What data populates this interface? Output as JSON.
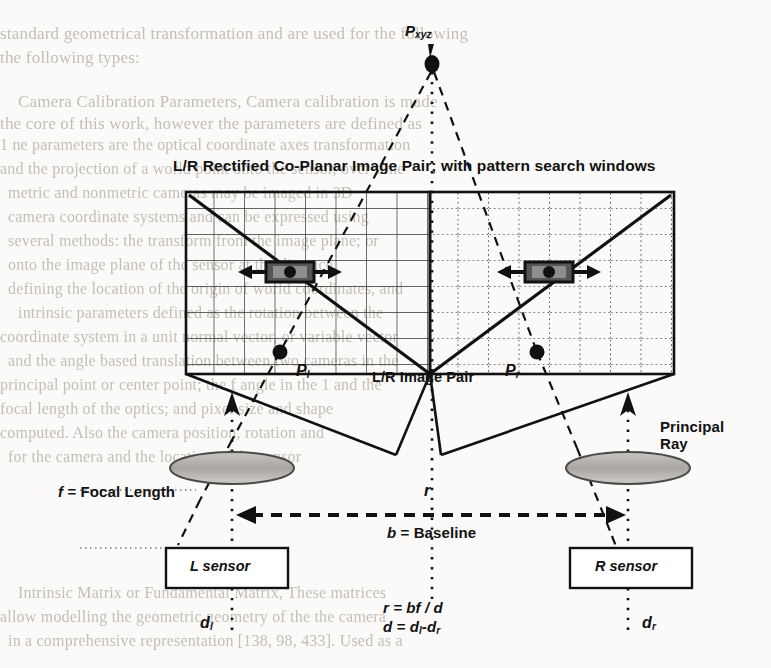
{
  "page": {
    "width": 771,
    "height": 668,
    "background_color": "#fbfaf8",
    "ink_color": "#111111",
    "bleed_text_color": "#b9b4ad"
  },
  "diagram": {
    "type": "stereo-camera-geometry",
    "title": "L/R Rectified Co-Planar Image Pair; with pattern search windows",
    "labels": {
      "world_point": "P",
      "world_point_sub": "xyz",
      "left_point": "P",
      "left_point_sub": "l",
      "right_point": "P",
      "right_point_sub": "r",
      "image_pair": "L/R Image Pair",
      "principal_ray": "Principal Ray",
      "focal_length": "f = Focal Length",
      "focal_length_symbol": "f",
      "focal_length_text": "= Focal Length",
      "baseline": "b = Baseline",
      "baseline_symbol": "b",
      "baseline_text": "= Baseline",
      "range": "r",
      "left_sensor": "L sensor",
      "right_sensor": "R sensor",
      "disparity_left": "d",
      "disparity_left_sub": "l",
      "disparity_right": "d",
      "disparity_right_sub": "r"
    },
    "formulas": [
      {
        "lhs": "r",
        "rhs": "= bf / d"
      },
      {
        "lhs": "d",
        "rhs": "= d",
        "sub1": "l",
        "mid": "-d",
        "sub2": "r"
      }
    ],
    "formula_lines": [
      "r = bf / d",
      "d = dl-dr"
    ],
    "left_image": {
      "grid_style": "solid",
      "diagonal": "descending"
    },
    "right_image": {
      "grid_style": "dotted",
      "diagonal": "ascending"
    },
    "search_windows": [
      {
        "side": "left",
        "arrows": "bidirectional"
      },
      {
        "side": "right",
        "arrows": "bidirectional"
      }
    ]
  },
  "background_text": {
    "lines": [
      {
        "text": "standard geometrical transformation and are used for the following",
        "x": 0,
        "y": 24,
        "size": 17,
        "mirror": false
      },
      {
        "text": "the following types:",
        "x": 0,
        "y": 48,
        "size": 17,
        "mirror": false
      },
      {
        "text": "Camera Calibration Parameters, Camera calibration is made",
        "x": 18,
        "y": 92,
        "size": 17,
        "mirror": false
      },
      {
        "text": "the core of this work, however the parameters are defined as",
        "x": 0,
        "y": 114,
        "size": 17,
        "mirror": false
      },
      {
        "text": "1 ne parameters are the optical coordinate axes transformation",
        "x": 0,
        "y": 136,
        "size": 16,
        "mirror": false
      },
      {
        "text": "and the projection of a world point onto the sensor, over-time",
        "x": 0,
        "y": 160,
        "size": 16,
        "mirror": false
      },
      {
        "text": "metric and nonmetric cameras may be imaged in 3D",
        "x": 8,
        "y": 184,
        "size": 16,
        "mirror": false
      },
      {
        "text": "camera coordinate systems and can be expressed using",
        "x": 8,
        "y": 208,
        "size": 16,
        "mirror": false
      },
      {
        "text": "several methods: the transform from the image plane; or",
        "x": 8,
        "y": 232,
        "size": 16,
        "mirror": false
      },
      {
        "text": "onto the image plane of the sensor at the distance",
        "x": 8,
        "y": 256,
        "size": 16,
        "mirror": false
      },
      {
        "text": "defining the location of the origin of world coordinates, and",
        "x": 8,
        "y": 280,
        "size": 16,
        "mirror": false
      },
      {
        "text": "intrinsic parameters defined as the rotation between the",
        "x": 18,
        "y": 304,
        "size": 16,
        "mirror": false
      },
      {
        "text": "coordinate system in a unit normal vector, or variable vector",
        "x": 0,
        "y": 328,
        "size": 16,
        "mirror": false
      },
      {
        "text": "and the angle based translation between two cameras in the",
        "x": 8,
        "y": 352,
        "size": 16,
        "mirror": false
      },
      {
        "text": "principal point or center point; the f angle in the 1 and the",
        "x": 0,
        "y": 376,
        "size": 16,
        "mirror": false
      },
      {
        "text": "focal length of the optics; and pixel size and shape",
        "x": 0,
        "y": 400,
        "size": 16,
        "mirror": false
      },
      {
        "text": "computed. Also the camera position, rotation and",
        "x": 0,
        "y": 424,
        "size": 16,
        "mirror": false
      },
      {
        "text": "for the camera and the location of the sensor",
        "x": 8,
        "y": 448,
        "size": 16,
        "mirror": false
      },
      {
        "text": "Intrinsic Matrix or Fundamental Matrix, These matrices",
        "x": 18,
        "y": 584,
        "size": 16,
        "mirror": false
      },
      {
        "text": "allow modelling the geometric geometry of the the camera",
        "x": 0,
        "y": 608,
        "size": 16,
        "mirror": false
      },
      {
        "text": "in a comprehensive representation [138, 98, 433]. Used as a",
        "x": 8,
        "y": 632,
        "size": 16,
        "mirror": false
      }
    ]
  }
}
